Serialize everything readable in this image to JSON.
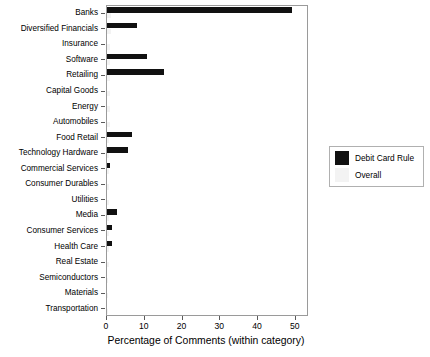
{
  "chart_data": {
    "type": "bar",
    "orientation": "horizontal",
    "title": "",
    "xlabel": "Percentage of Comments (within category)",
    "ylabel": "",
    "xlim": [
      0,
      53.5
    ],
    "xticks": [
      0,
      10,
      20,
      30,
      40,
      50
    ],
    "grid": false,
    "legend_position": "right",
    "categories": [
      "Banks",
      "Diversified Financials",
      "Insurance",
      "Software",
      "Retailing",
      "Capital Goods",
      "Energy",
      "Automobiles",
      "Food Retail",
      "Technology Hardware",
      "Commercial Services",
      "Consumer Durables",
      "Utilities",
      "Media",
      "Consumer Services",
      "Health Care",
      "Real Estate",
      "Semiconductors",
      "Materials",
      "Transportation"
    ],
    "series": [
      {
        "name": "Debit Card Rule",
        "color": "#111111",
        "values": [
          49.0,
          8.0,
          0.0,
          10.5,
          15.0,
          0.0,
          0.0,
          0.0,
          6.6,
          5.6,
          0.9,
          0.0,
          0.0,
          2.6,
          1.2,
          1.3,
          0.0,
          0.0,
          0.0,
          0.0
        ]
      },
      {
        "name": "Overall",
        "color": "#f3f3f3",
        "values": [
          1.1,
          1.0,
          0.9,
          0.8,
          0.8,
          0.8,
          0.7,
          0.7,
          0.6,
          0.6,
          0.6,
          0.5,
          0.5,
          0.5,
          0.4,
          0.4,
          0.4,
          0.3,
          0.3,
          0.3
        ]
      }
    ],
    "legend": [
      {
        "label": "Debit Card Rule",
        "color": "#111111"
      },
      {
        "label": "Overall",
        "color": "#f3f3f3"
      }
    ]
  }
}
